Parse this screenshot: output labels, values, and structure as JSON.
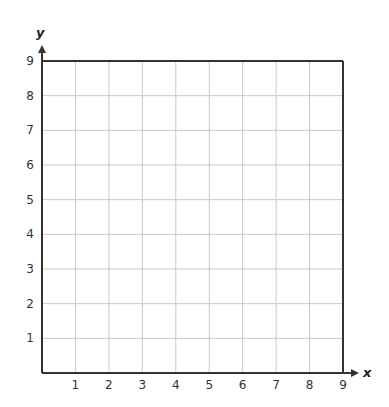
{
  "chart_data": {
    "type": "scatter",
    "title": "",
    "xlabel": "x",
    "ylabel": "y",
    "xlim": [
      0,
      9
    ],
    "ylim": [
      0,
      9
    ],
    "x_ticks": [
      "1",
      "2",
      "3",
      "4",
      "5",
      "6",
      "7",
      "8",
      "9"
    ],
    "y_ticks": [
      "1",
      "2",
      "3",
      "4",
      "5",
      "6",
      "7",
      "8",
      "9"
    ],
    "grid": true,
    "series": [],
    "legend": null
  },
  "colors": {
    "grid": "#c8c8c8",
    "axis": "#333333",
    "text": "#333333"
  }
}
